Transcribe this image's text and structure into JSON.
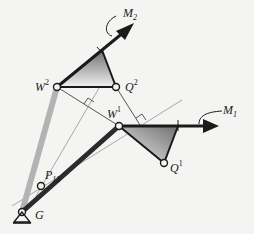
{
  "figure": {
    "type": "planar linkage diagram",
    "colors": {
      "background": "#f4f4f2",
      "dark_link": "#2b2b2b",
      "light_link": "#b3b3b3",
      "thin_line": "#555555",
      "construction_line": "#a8a8a8",
      "triangle_fill_dark": "#7a7a7a",
      "triangle_fill_light": "#ececec"
    }
  },
  "labels": {
    "M2": {
      "main": "M",
      "sub": "2"
    },
    "M1": {
      "main": "M",
      "sub": "1"
    },
    "W2": {
      "main": "W",
      "sup": "2"
    },
    "Q2": {
      "main": "Q",
      "sup": "2"
    },
    "W1": {
      "main": "W",
      "sup": "1"
    },
    "Q1": {
      "main": "Q",
      "sup": "1"
    },
    "P12": {
      "main": "P",
      "sub": "12"
    },
    "G": {
      "main": "G"
    }
  },
  "points": {
    "G": [
      22,
      212
    ],
    "P12": [
      41,
      186
    ],
    "W2": [
      57,
      87
    ],
    "Q2": [
      116,
      87
    ],
    "W1": [
      119,
      126
    ],
    "Q1": [
      164,
      163
    ]
  },
  "icons": [
    "ground-pivot-icon",
    "moment-arrow-icon",
    "right-angle-marker-icon"
  ]
}
